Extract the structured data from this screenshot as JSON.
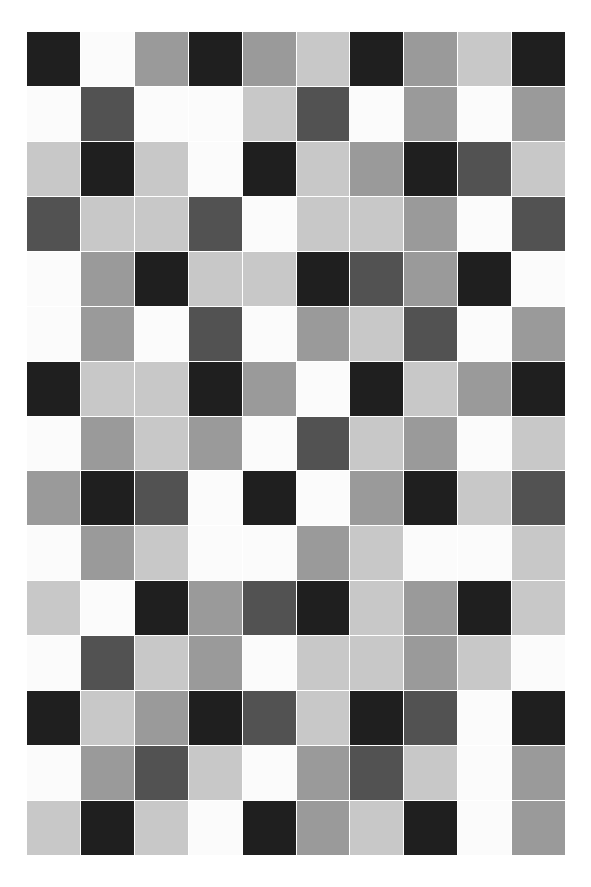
{
  "canvas": {
    "width": 591,
    "height": 887,
    "background": "#ffffff",
    "title": "Grayscale Tile Grid"
  },
  "grid": {
    "columns": 10,
    "rows": 15,
    "left": 27,
    "top": 32,
    "width": 538,
    "height": 823,
    "cell_width": 53.8,
    "cell_height": 54.9,
    "gap": 1,
    "gap_color": "#ffffff"
  },
  "palette": {
    "black": "#1f1f1f",
    "dark_gray": "#525252",
    "mid_gray": "#9a9a9a",
    "light_gray": "#c8c8c8",
    "white": "#fbfbfb"
  },
  "chart_data": {
    "type": "heatmap",
    "xlabel": "",
    "ylabel": "",
    "grid": true,
    "legend": "none",
    "categories_x": [
      "1",
      "2",
      "3",
      "4",
      "5",
      "6",
      "7",
      "8",
      "9",
      "10"
    ],
    "categories_y": [
      "1",
      "2",
      "3",
      "4",
      "5",
      "6",
      "7",
      "8",
      "9",
      "10",
      "11",
      "12",
      "13",
      "14",
      "15"
    ],
    "value_labels": [
      "black",
      "dark_gray",
      "mid_gray",
      "light_gray",
      "white"
    ],
    "value_levels": [
      0,
      1,
      2,
      3,
      4
    ],
    "colors": [
      "#1f1f1f",
      "#525252",
      "#9a9a9a",
      "#c8c8c8",
      "#fbfbfb"
    ],
    "cells": [
      [
        "black",
        "white",
        "mid_gray",
        "black",
        "mid_gray",
        "light_gray",
        "black",
        "mid_gray",
        "light_gray",
        "black"
      ],
      [
        "white",
        "dark_gray",
        "white",
        "white",
        "light_gray",
        "dark_gray",
        "white",
        "mid_gray",
        "white",
        "mid_gray"
      ],
      [
        "light_gray",
        "black",
        "light_gray",
        "white",
        "black",
        "light_gray",
        "mid_gray",
        "black",
        "dark_gray",
        "light_gray"
      ],
      [
        "dark_gray",
        "light_gray",
        "light_gray",
        "dark_gray",
        "white",
        "light_gray",
        "light_gray",
        "mid_gray",
        "white",
        "dark_gray"
      ],
      [
        "white",
        "mid_gray",
        "black",
        "light_gray",
        "light_gray",
        "black",
        "dark_gray",
        "mid_gray",
        "black",
        "white"
      ],
      [
        "white",
        "mid_gray",
        "white",
        "dark_gray",
        "white",
        "mid_gray",
        "light_gray",
        "dark_gray",
        "white",
        "mid_gray"
      ],
      [
        "black",
        "light_gray",
        "light_gray",
        "black",
        "mid_gray",
        "white",
        "black",
        "light_gray",
        "mid_gray",
        "black"
      ],
      [
        "white",
        "mid_gray",
        "light_gray",
        "mid_gray",
        "white",
        "dark_gray",
        "light_gray",
        "mid_gray",
        "white",
        "light_gray"
      ],
      [
        "mid_gray",
        "black",
        "dark_gray",
        "white",
        "black",
        "white",
        "mid_gray",
        "black",
        "light_gray",
        "dark_gray"
      ],
      [
        "white",
        "mid_gray",
        "light_gray",
        "white",
        "white",
        "mid_gray",
        "light_gray",
        "white",
        "white",
        "light_gray"
      ],
      [
        "light_gray",
        "white",
        "black",
        "mid_gray",
        "dark_gray",
        "black",
        "light_gray",
        "mid_gray",
        "black",
        "light_gray"
      ],
      [
        "white",
        "dark_gray",
        "light_gray",
        "mid_gray",
        "white",
        "light_gray",
        "light_gray",
        "mid_gray",
        "light_gray",
        "white"
      ],
      [
        "black",
        "light_gray",
        "mid_gray",
        "black",
        "dark_gray",
        "light_gray",
        "black",
        "dark_gray",
        "white",
        "black"
      ],
      [
        "white",
        "mid_gray",
        "dark_gray",
        "light_gray",
        "white",
        "mid_gray",
        "dark_gray",
        "light_gray",
        "white",
        "mid_gray"
      ],
      [
        "light_gray",
        "black",
        "light_gray",
        "white",
        "black",
        "mid_gray",
        "light_gray",
        "black",
        "white",
        "mid_gray"
      ]
    ]
  }
}
